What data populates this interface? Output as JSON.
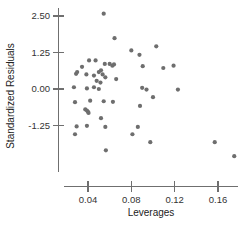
{
  "chart_data": {
    "type": "scatter",
    "title": "",
    "xlabel": "Leverages",
    "ylabel": "Standardized Residuals",
    "xlim": [
      0.018,
      0.182
    ],
    "ylim": [
      -2.65,
      2.75
    ],
    "xticks": [
      0.04,
      0.08,
      0.12,
      0.16
    ],
    "xtick_labels": [
      "0.04",
      "0.08",
      "0.12",
      "0.16"
    ],
    "yticks": [
      2.5,
      1.25,
      0.0,
      -1.25
    ],
    "ytick_labels": [
      "2.50",
      "1.25",
      "0.00",
      "-1.25"
    ],
    "grid": false,
    "legend": false,
    "marker_color": "#6e6e6e",
    "marker_size": 4.2,
    "axis_color": "#6f6f6f",
    "points": [
      {
        "x": 0.0545,
        "y": 2.58
      },
      {
        "x": 0.0645,
        "y": 1.74
      },
      {
        "x": 0.08,
        "y": 1.32
      },
      {
        "x": 0.103,
        "y": 1.46
      },
      {
        "x": 0.0875,
        "y": 1.17
      },
      {
        "x": 0.0905,
        "y": 0.78
      },
      {
        "x": 0.041,
        "y": 0.98
      },
      {
        "x": 0.047,
        "y": 0.98
      },
      {
        "x": 0.0345,
        "y": 0.76
      },
      {
        "x": 0.0555,
        "y": 0.86
      },
      {
        "x": 0.06,
        "y": 0.86
      },
      {
        "x": 0.0625,
        "y": 0.8
      },
      {
        "x": 0.064,
        "y": 0.84
      },
      {
        "x": 0.1095,
        "y": 0.72
      },
      {
        "x": 0.119,
        "y": 0.8
      },
      {
        "x": 0.029,
        "y": 0.52
      },
      {
        "x": 0.03,
        "y": 0.58
      },
      {
        "x": 0.0385,
        "y": 0.5
      },
      {
        "x": 0.0455,
        "y": 0.46
      },
      {
        "x": 0.05,
        "y": 0.58
      },
      {
        "x": 0.052,
        "y": 0.64
      },
      {
        "x": 0.0535,
        "y": 0.5
      },
      {
        "x": 0.056,
        "y": 0.4
      },
      {
        "x": 0.048,
        "y": 0.28
      },
      {
        "x": 0.0515,
        "y": 0.22
      },
      {
        "x": 0.066,
        "y": 0.34
      },
      {
        "x": 0.027,
        "y": 0.06
      },
      {
        "x": 0.039,
        "y": 0.02
      },
      {
        "x": 0.0455,
        "y": 0.06
      },
      {
        "x": 0.05,
        "y": 0.0
      },
      {
        "x": 0.09,
        "y": 0.04
      },
      {
        "x": 0.094,
        "y": -0.02
      },
      {
        "x": 0.123,
        "y": -0.02
      },
      {
        "x": 0.028,
        "y": -0.45
      },
      {
        "x": 0.042,
        "y": -0.4
      },
      {
        "x": 0.0545,
        "y": -0.42
      },
      {
        "x": 0.063,
        "y": -0.44
      },
      {
        "x": 0.1,
        "y": -0.28
      },
      {
        "x": 0.0375,
        "y": -0.7
      },
      {
        "x": 0.039,
        "y": -0.74
      },
      {
        "x": 0.04,
        "y": -0.78
      },
      {
        "x": 0.0405,
        "y": -0.82
      },
      {
        "x": 0.088,
        "y": -0.58
      },
      {
        "x": 0.052,
        "y": -1.0
      },
      {
        "x": 0.056,
        "y": -1.3
      },
      {
        "x": 0.086,
        "y": -1.3
      },
      {
        "x": 0.0295,
        "y": -1.28
      },
      {
        "x": 0.039,
        "y": -1.26
      },
      {
        "x": 0.028,
        "y": -1.55
      },
      {
        "x": 0.081,
        "y": -1.55
      },
      {
        "x": 0.0975,
        "y": -1.82
      },
      {
        "x": 0.157,
        "y": -1.82
      },
      {
        "x": 0.0565,
        "y": -2.1
      },
      {
        "x": 0.175,
        "y": -2.3
      }
    ]
  }
}
